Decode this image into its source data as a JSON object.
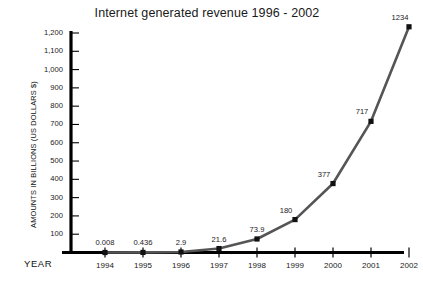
{
  "chart_data": {
    "type": "line",
    "title": "Internet generated revenue 1996 - 2002",
    "xlabel": "YEAR",
    "ylabel": "AMOUNTS IN BILLIONS (US DOLLARS $)",
    "categories": [
      "1994",
      "1995",
      "1996",
      "1997",
      "1998",
      "1999",
      "2000",
      "2001",
      "2002"
    ],
    "values": [
      0.008,
      0.436,
      2.9,
      21.6,
      73.9,
      180,
      377,
      717,
      1234
    ],
    "point_labels": [
      "0.008",
      "0.436",
      "2.9",
      "21.6",
      "73.9",
      "180",
      "377",
      "717",
      "1234"
    ],
    "ylim": [
      0,
      1200
    ],
    "ytick_values": [
      100,
      200,
      300,
      400,
      500,
      600,
      700,
      800,
      900,
      1000,
      1100,
      1200
    ],
    "ytick_labels": [
      "100",
      "200",
      "300",
      "400",
      "500",
      "600",
      "700",
      "800",
      "900",
      "1,000",
      "1,100",
      "1,200"
    ],
    "grid": false,
    "legend": false,
    "legend_position": "none",
    "line_color": "#555555",
    "marker_color": "#111111",
    "marker_shape": "square",
    "axis_color": "#000000",
    "background_color": "#ffffff"
  }
}
